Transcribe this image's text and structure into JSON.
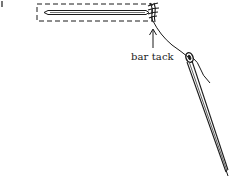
{
  "diagram": {
    "labels": {
      "bar_tack": "bar tack"
    },
    "colors": {
      "ink": "#1a1a1a",
      "background": "#ffffff"
    }
  }
}
